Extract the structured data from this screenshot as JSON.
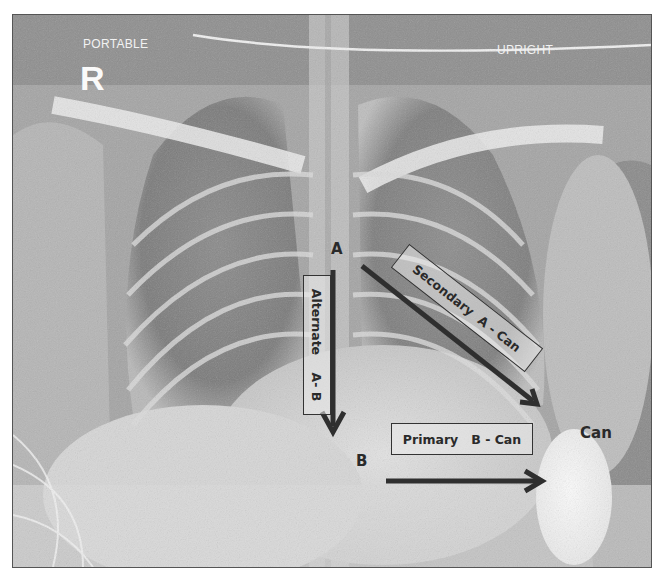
{
  "image": {
    "description": "Portable upright chest X-ray annotated with electrode/can vector paths",
    "markers": {
      "portable": "PORTABLE",
      "upright": "UPRIGHT",
      "side_marker": "R"
    }
  },
  "annotations": {
    "point_a": "A",
    "point_b": "B",
    "can": "Can",
    "alternate_box": "Alternate    A- B",
    "secondary_box": "Secondary  A - Can",
    "primary_box": "Primary   B - Can"
  },
  "colors": {
    "arrow": "#2f2f2f",
    "box_border": "#333333",
    "label_text": "#2a2a2a",
    "marker_text": "#f2f2f2"
  }
}
